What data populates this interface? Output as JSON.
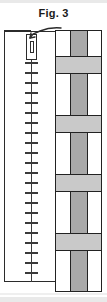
{
  "figure": {
    "caption": "Fig. 3",
    "caption_color": "#1a1a1a",
    "ink_color": "#2b2b2b",
    "background_color": "#ffffff"
  },
  "vessel": {
    "name": "tall-open-vessel",
    "outline_color": "#2b2b2b",
    "fill_color": "#ffffff"
  },
  "scale": {
    "name": "graduated-scale",
    "tick_count": 22,
    "tick_spacing_px": 10,
    "first_tick_y_px": 62,
    "line_color": "#3a3a3a"
  },
  "probe": {
    "name": "probe-detail",
    "outer_fill": "#ffffff",
    "inner_fill": "#ffffff",
    "outline_color": "#2b2b2b"
  },
  "leader": {
    "name": "leader-line",
    "color": "#2b2b2b"
  },
  "block": {
    "name": "layered-stack",
    "outline_color": "#222222",
    "pillar_color": "#a9a9a9",
    "band_color": "#c9c9c9",
    "void_color": "#ffffff",
    "rows": [
      {
        "type": "cells",
        "height_px": 26
      },
      {
        "type": "band",
        "height_px": 17
      },
      {
        "type": "cells",
        "height_px": 42
      },
      {
        "type": "band",
        "height_px": 17
      },
      {
        "type": "cells",
        "height_px": 42
      },
      {
        "type": "band",
        "height_px": 17
      },
      {
        "type": "cells",
        "height_px": 42
      },
      {
        "type": "band",
        "height_px": 17
      },
      {
        "type": "cells",
        "height_px": 42
      }
    ]
  }
}
